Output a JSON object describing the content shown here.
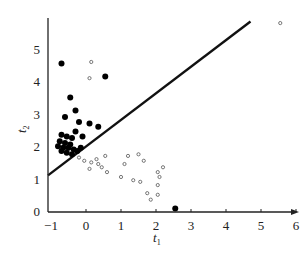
{
  "chart_data": {
    "type": "scatter",
    "title": "",
    "xlabel": "t1",
    "ylabel": "t2",
    "xlabel_main": "t",
    "xlabel_sub": "1",
    "ylabel_main": "t",
    "ylabel_sub": "2",
    "xlim": [
      -1,
      6
    ],
    "ylim": [
      0,
      5.8
    ],
    "x_ticks": [
      -1,
      0,
      1,
      2,
      3,
      4,
      5,
      6
    ],
    "y_ticks": [
      0,
      1,
      2,
      3,
      4,
      5
    ],
    "grid": false,
    "legend": null,
    "decision_boundary": {
      "type": "line",
      "from": [
        -1,
        1.1
      ],
      "to": [
        4.7,
        5.85
      ]
    },
    "series": [
      {
        "name": "class-filled",
        "marker": "filled-circle",
        "points": [
          [
            -0.7,
            4.55
          ],
          [
            0.55,
            4.15
          ],
          [
            -0.45,
            3.5
          ],
          [
            -0.3,
            3.1
          ],
          [
            -0.6,
            2.9
          ],
          [
            -0.2,
            2.75
          ],
          [
            0.1,
            2.7
          ],
          [
            0.35,
            2.6
          ],
          [
            -0.3,
            2.45
          ],
          [
            -0.1,
            2.3
          ],
          [
            -0.7,
            2.35
          ],
          [
            -0.55,
            2.3
          ],
          [
            -0.4,
            2.25
          ],
          [
            -0.75,
            2.15
          ],
          [
            -0.6,
            2.1
          ],
          [
            -0.45,
            2.05
          ],
          [
            -0.8,
            2.0
          ],
          [
            -0.65,
            1.95
          ],
          [
            -0.5,
            1.95
          ],
          [
            -0.35,
            1.9
          ],
          [
            -0.7,
            1.85
          ],
          [
            -0.55,
            1.8
          ],
          [
            -0.4,
            1.75
          ],
          [
            -0.25,
            1.85
          ],
          [
            -0.15,
            1.95
          ],
          [
            2.55,
            0.08
          ]
        ]
      },
      {
        "name": "class-open",
        "marker": "open-circle",
        "points": [
          [
            5.55,
            5.8
          ],
          [
            0.15,
            4.6
          ],
          [
            0.1,
            4.1
          ],
          [
            -0.2,
            1.65
          ],
          [
            -0.05,
            1.55
          ],
          [
            0.15,
            1.5
          ],
          [
            0.3,
            1.6
          ],
          [
            0.35,
            1.45
          ],
          [
            0.45,
            1.35
          ],
          [
            0.55,
            1.7
          ],
          [
            0.1,
            1.3
          ],
          [
            0.6,
            1.2
          ],
          [
            1.2,
            1.7
          ],
          [
            1.5,
            1.75
          ],
          [
            1.1,
            1.45
          ],
          [
            1.65,
            1.55
          ],
          [
            1.0,
            1.05
          ],
          [
            1.35,
            0.95
          ],
          [
            1.55,
            0.9
          ],
          [
            2.2,
            1.35
          ],
          [
            2.05,
            1.2
          ],
          [
            2.1,
            1.05
          ],
          [
            2.05,
            0.8
          ],
          [
            1.75,
            0.55
          ],
          [
            1.85,
            0.35
          ],
          [
            2.05,
            0.5
          ]
        ]
      }
    ]
  }
}
